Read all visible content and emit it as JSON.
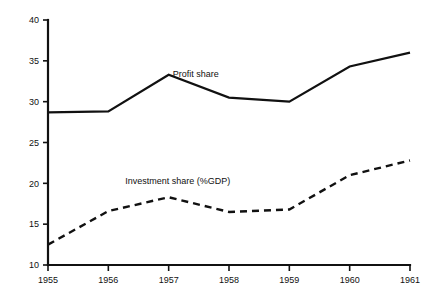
{
  "chart_data": {
    "type": "line",
    "title": "",
    "subtitle": "",
    "xlabel": "",
    "ylabel": "",
    "x": [
      1955,
      1956,
      1957,
      1958,
      1959,
      1960,
      1961
    ],
    "xtick_labels": [
      "1955",
      "1956",
      "1957",
      "1958",
      "1959",
      "1960",
      "1961"
    ],
    "ytick_labels": [
      "10",
      "15",
      "20",
      "25",
      "30",
      "35",
      "40"
    ],
    "yticks": [
      10,
      15,
      20,
      25,
      30,
      35,
      40
    ],
    "xlim": [
      1955,
      1961
    ],
    "ylim": [
      10,
      40
    ],
    "grid": false,
    "legend_position": "inline-annotation",
    "series": [
      {
        "name": "Profit share",
        "style": "solid",
        "color": "#111111",
        "values": [
          28.7,
          28.8,
          33.3,
          30.5,
          30.0,
          34.3,
          36.0
        ],
        "annotation": "Profit share"
      },
      {
        "name": "Investment share (%GDP)",
        "style": "dashed",
        "color": "#111111",
        "values": [
          12.5,
          16.6,
          18.3,
          16.5,
          16.8,
          21.0,
          22.8
        ],
        "annotation": "Investment share (%GDP)"
      }
    ],
    "annotations": [
      {
        "text": "Profit share",
        "x": 1957.45,
        "y": 33.0
      },
      {
        "text": "Investment share (%GDP)",
        "x": 1957.15,
        "y": 19.9
      }
    ]
  }
}
